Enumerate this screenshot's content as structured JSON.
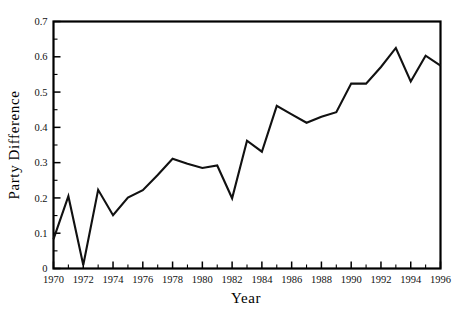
{
  "chart_data": {
    "type": "line",
    "title": "",
    "xlabel": "Year",
    "ylabel": "Party Difference",
    "xlim": [
      1970,
      1996
    ],
    "ylim": [
      0,
      0.7
    ],
    "grid": false,
    "legend": null,
    "x_major_ticks": [
      1970,
      1972,
      1974,
      1976,
      1978,
      1980,
      1982,
      1984,
      1986,
      1988,
      1990,
      1992,
      1994,
      1996
    ],
    "x_minor_ticks": [
      1971,
      1973,
      1975,
      1977,
      1979,
      1981,
      1983,
      1985,
      1987,
      1989,
      1991,
      1993,
      1995
    ],
    "x_tick_labels": [
      "1970",
      "1972",
      "1974",
      "1976",
      "1978",
      "1980",
      "1982",
      "1984",
      "1986",
      "1988",
      "1990",
      "1992",
      "1994",
      "1996"
    ],
    "y_major_ticks": [
      0,
      0.1,
      0.2,
      0.3,
      0.4,
      0.5,
      0.6,
      0.7
    ],
    "y_minor_ticks": [
      0.05,
      0.15,
      0.25,
      0.35,
      0.45,
      0.55,
      0.65
    ],
    "y_tick_labels": [
      "0",
      "0.1",
      "0.2",
      "0.3",
      "0.4",
      "0.5",
      "0.6",
      "0.7"
    ],
    "series": [
      {
        "name": "Party Difference",
        "color": "#111111",
        "x": [
          1970,
          1971,
          1972,
          1973,
          1974,
          1975,
          1976,
          1977,
          1978,
          1979,
          1980,
          1981,
          1982,
          1983,
          1984,
          1985,
          1986,
          1987,
          1988,
          1989,
          1990,
          1991,
          1992,
          1993,
          1994,
          1995,
          1996
        ],
        "values": [
          0.083,
          0.205,
          0.01,
          0.223,
          0.151,
          0.201,
          0.222,
          0.265,
          0.311,
          0.297,
          0.285,
          0.292,
          0.199,
          0.362,
          0.331,
          0.461,
          0.437,
          0.413,
          0.43,
          0.443,
          0.524,
          0.524,
          0.571,
          0.625,
          0.53,
          0.603,
          0.575
        ]
      }
    ]
  },
  "axes": {
    "x_axis_name": "Year",
    "y_axis_name": "Party Difference"
  }
}
